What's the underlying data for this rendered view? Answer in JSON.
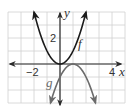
{
  "chart_data": {
    "type": "line",
    "title": "",
    "xlabel": "x",
    "ylabel": "y",
    "xlim": [
      -4,
      5
    ],
    "ylim": [
      -3,
      4
    ],
    "grid": true,
    "grid_step": 1,
    "x_tick_labels": [
      {
        "value": -2,
        "text": "−2"
      },
      {
        "value": 4,
        "text": "4"
      }
    ],
    "y_tick_labels": [
      {
        "value": 2,
        "text": "2"
      }
    ],
    "series": [
      {
        "name": "f",
        "equation": "f(x) = x^2",
        "color": "#1a1a1a",
        "x": [
          -2,
          -1.5,
          -1,
          -0.5,
          0,
          0.5,
          1,
          1.5,
          2
        ],
        "y": [
          4,
          2.25,
          1,
          0.25,
          0,
          0.25,
          1,
          2.25,
          4
        ],
        "arrows": "both ends"
      },
      {
        "name": "g",
        "equation": "g(x) = -(x - 1)^2",
        "color": "#6b6b6b",
        "x": [
          -0.73,
          0,
          0.5,
          1,
          1.5,
          2,
          2.73
        ],
        "y": [
          -3,
          -1,
          -0.25,
          0,
          -0.25,
          -1,
          -3
        ],
        "arrows": "both ends"
      }
    ],
    "annotations": [
      {
        "text": "f",
        "near_series": "f"
      },
      {
        "text": "g",
        "near_series": "g"
      }
    ]
  },
  "labels": {
    "x_axis": "x",
    "y_axis": "y",
    "x_tick_neg2": "−2",
    "x_tick_4": "4",
    "y_tick_2": "2",
    "curve_f": "f",
    "curve_g": "g"
  },
  "colors": {
    "grid": "#d0d0d0",
    "axis": "#2a2a2a",
    "f": "#1a1a1a",
    "g": "#6b6b6b"
  }
}
